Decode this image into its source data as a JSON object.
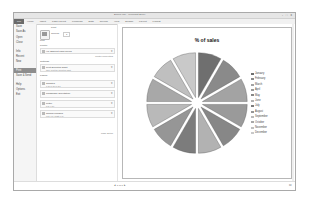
{
  "window": {
    "title": "Book1.xlsx - Microsoft Excel",
    "controls": "- □ x"
  },
  "ribbon": {
    "tabs": [
      "File",
      "Home",
      "Insert",
      "Page Layout",
      "Formulas",
      "Data",
      "Review",
      "View",
      "Design",
      "Layout",
      "Format"
    ]
  },
  "nav": {
    "items": [
      {
        "label": "Save"
      },
      {
        "label": "Save As"
      },
      {
        "label": "Open"
      },
      {
        "label": "Close"
      },
      {
        "label": "Info"
      },
      {
        "label": "Recent"
      },
      {
        "label": "New"
      },
      {
        "label": "Print",
        "selected": true
      },
      {
        "label": "Save & Send"
      },
      {
        "label": "Help"
      },
      {
        "label": "Options"
      },
      {
        "label": "Exit"
      }
    ]
  },
  "print": {
    "heading": "Print",
    "button_label": "Print",
    "copies_label": "Copies:",
    "copies_value": "1",
    "printer_heading": "Printer",
    "printer_name": "HP Officejet 6500 series",
    "printer_status": "Ready",
    "printer_properties": "Printer Properties",
    "settings_heading": "Settings",
    "settings": [
      {
        "value": "Print Selected Chart",
        "sub": "Only print the selected chart"
      },
      {
        "value": "Collated",
        "sub": "1,2,3  1,2,3  1,2,3"
      },
      {
        "value": "Landscape Orientation",
        "sub": ""
      },
      {
        "value": "Letter",
        "sub": "8.5\" x 11\""
      },
      {
        "value": "Normal Margins",
        "sub": "Left: 0.7\"  Right: 0.7\""
      }
    ],
    "pages_label": "Pages:",
    "to_label": "to",
    "page_setup": "Page Setup"
  },
  "status": {
    "page_nav": "◂ 1 of 1 ▸",
    "zoom": "⊡"
  },
  "chart_data": {
    "type": "pie",
    "title": "% of sales",
    "exploded": true,
    "categories": [
      "January",
      "February",
      "March",
      "April",
      "May",
      "June",
      "July",
      "August",
      "September",
      "October",
      "November",
      "December"
    ],
    "values": [
      8.3,
      8.3,
      8.3,
      8.3,
      8.3,
      8.3,
      8.3,
      8.3,
      8.3,
      8.3,
      8.3,
      8.3
    ],
    "colors": [
      "#6f6f6f",
      "#8a8a8a",
      "#a3a3a3",
      "#9a9a9a",
      "#878787",
      "#b2b2b2",
      "#7c7c7c",
      "#969696",
      "#b9b9b9",
      "#a8a8a8",
      "#bfbfbf",
      "#c9c9c9"
    ],
    "legend_position": "right"
  }
}
